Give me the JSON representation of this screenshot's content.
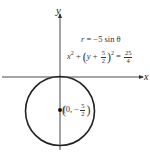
{
  "axes": {
    "x_label": "x",
    "y_label": "y"
  },
  "equations": {
    "polar": {
      "lhs": "r",
      "eq": "=",
      "rhs": "−5 sin θ"
    },
    "cartesian": {
      "x_term": "x",
      "x_exp": "2",
      "plus": "+",
      "y_var": "y",
      "y_op": "+",
      "frac_num": "5",
      "frac_den": "2",
      "y_exp": "2",
      "eq": "=",
      "rhs_num": "25",
      "rhs_den": "4"
    }
  },
  "center_point": {
    "label_open": "(0, −",
    "frac_num": "5",
    "frac_den": "2",
    "label_close": ")"
  },
  "colors": {
    "stroke": "#222222",
    "text": "#333333"
  }
}
